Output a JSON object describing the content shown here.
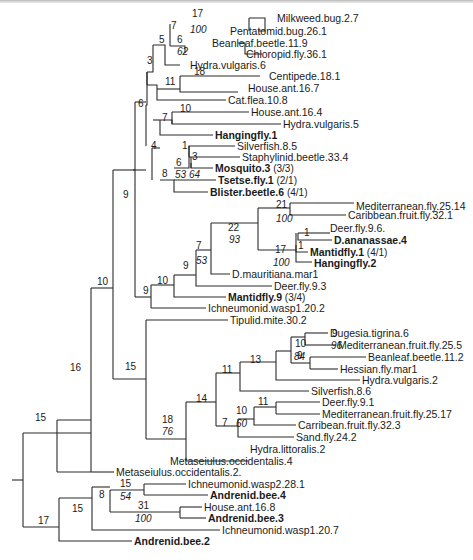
{
  "diagram": {
    "type": "phylogenetic-tree",
    "leaves": [
      {
        "id": "l0",
        "label": "Milkweed.bug.2.7",
        "bold": false,
        "x": 277,
        "y": 18
      },
      {
        "id": "l1",
        "label": "Pentatomid.bug.26.1",
        "bold": false,
        "x": 230,
        "y": 31
      },
      {
        "id": "l2",
        "label": "Beanleaf.beetle.11.9",
        "bold": false,
        "x": 212,
        "y": 43
      },
      {
        "id": "l3",
        "label": "Chloropid.fly.36.1",
        "bold": false,
        "x": 246,
        "y": 54
      },
      {
        "id": "l4",
        "label": "Hydra.vulgaris.6",
        "bold": false,
        "x": 190,
        "y": 65
      },
      {
        "id": "l5",
        "label": "Centipede.18.1",
        "bold": false,
        "x": 269,
        "y": 76
      },
      {
        "id": "l6",
        "label": "House.ant.16.7",
        "bold": false,
        "x": 248,
        "y": 88
      },
      {
        "id": "l7",
        "label": "Cat.flea.10.8",
        "bold": false,
        "x": 228,
        "y": 100
      },
      {
        "id": "l8",
        "label": "House.ant.16.4",
        "bold": false,
        "x": 251,
        "y": 112
      },
      {
        "id": "l9",
        "label": "Hydra.vulgaris.5",
        "bold": false,
        "x": 283,
        "y": 124
      },
      {
        "id": "l10",
        "label": "Hangingfly.1",
        "bold": true,
        "x": 215,
        "y": 135
      },
      {
        "id": "l11",
        "label": "Silverfish.8.5",
        "bold": false,
        "x": 237,
        "y": 146
      },
      {
        "id": "l12",
        "label": "Staphylinid.beetle.33.4",
        "bold": false,
        "x": 242,
        "y": 157
      },
      {
        "id": "l13",
        "label": "Mosquito.3",
        "bold": true,
        "suffix": "(3/3)",
        "x": 215,
        "y": 168
      },
      {
        "id": "l14",
        "label": "Tsetse.fly.1",
        "bold": true,
        "suffix": "(2/1)",
        "x": 218,
        "y": 180
      },
      {
        "id": "l15",
        "label": "Blister.beetle.6",
        "bold": true,
        "suffix": "(4/1)",
        "x": 210,
        "y": 192
      },
      {
        "id": "l16",
        "label": "Mediterranean.fly.25.14",
        "bold": false,
        "x": 356,
        "y": 206
      },
      {
        "id": "l17",
        "label": "Caribbean.fruit.fly.32.1",
        "bold": false,
        "x": 348,
        "y": 215
      },
      {
        "id": "l18",
        "label": "Deer.fly.9.6.",
        "bold": false,
        "x": 330,
        "y": 228
      },
      {
        "id": "l19",
        "label": "D.ananassae.4",
        "bold": true,
        "x": 334,
        "y": 240
      },
      {
        "id": "l20",
        "label": "Mantidfly.1",
        "bold": true,
        "suffix": "(4/1)",
        "x": 310,
        "y": 252
      },
      {
        "id": "l21",
        "label": "Hangingfly.2",
        "bold": true,
        "x": 314,
        "y": 263
      },
      {
        "id": "l22",
        "label": "D.mauritiana.mar1",
        "bold": false,
        "x": 232,
        "y": 274
      },
      {
        "id": "l23",
        "label": "Deer.fly.9.3",
        "bold": false,
        "x": 274,
        "y": 286
      },
      {
        "id": "l24",
        "label": "Mantidfly.9",
        "bold": true,
        "suffix": "(3/4)",
        "x": 228,
        "y": 297
      },
      {
        "id": "l25",
        "label": "Ichneumonid.wasp1.20.2",
        "bold": false,
        "x": 208,
        "y": 308
      },
      {
        "id": "l26",
        "label": "Tipulid.mite.30.2",
        "bold": false,
        "x": 230,
        "y": 320
      },
      {
        "id": "l27",
        "label": "Dugesia.tigrina.6",
        "bold": false,
        "x": 330,
        "y": 333
      },
      {
        "id": "l28",
        "label": "Mediterranean.fruit.fly.25.5",
        "bold": false,
        "x": 338,
        "y": 345
      },
      {
        "id": "l29",
        "label": "Beanleaf.beetle.11.2",
        "bold": false,
        "x": 368,
        "y": 357
      },
      {
        "id": "l30",
        "label": "Hessian.fly.mar1",
        "bold": false,
        "x": 340,
        "y": 369
      },
      {
        "id": "l31",
        "label": "Hydra.vulgaris.2",
        "bold": false,
        "x": 362,
        "y": 380
      },
      {
        "id": "l32",
        "label": "Silverfish.8.6",
        "bold": false,
        "x": 311,
        "y": 391
      },
      {
        "id": "l33",
        "label": "Deer.fly.9.1",
        "bold": false,
        "x": 322,
        "y": 402
      },
      {
        "id": "l34",
        "label": "Mediterranean.fruit.fly.25.17",
        "bold": false,
        "x": 322,
        "y": 414
      },
      {
        "id": "l35",
        "label": "Carribean.fruit.fly.32.3",
        "bold": false,
        "x": 298,
        "y": 425
      },
      {
        "id": "l36",
        "label": "Sand.fly.24.2",
        "bold": false,
        "x": 296,
        "y": 437
      },
      {
        "id": "l37",
        "label": "Hydra.littoralis.2",
        "bold": false,
        "x": 250,
        "y": 449
      },
      {
        "id": "l38",
        "label": "Metaseiulus.occidentalis.4",
        "bold": false,
        "x": 170,
        "y": 461
      },
      {
        "id": "l39",
        "label": "Metaseiulus.occidentalis.2.",
        "bold": false,
        "x": 116,
        "y": 472
      },
      {
        "id": "l40",
        "label": "Ichneumonid.wasp2.28.1",
        "bold": false,
        "x": 188,
        "y": 484
      },
      {
        "id": "l41",
        "label": "Andrenid.bee.4",
        "bold": true,
        "x": 210,
        "y": 495
      },
      {
        "id": "l42",
        "label": "House.ant.16.8",
        "bold": false,
        "x": 204,
        "y": 507
      },
      {
        "id": "l43",
        "label": "Andrenid.bee.3",
        "bold": true,
        "x": 208,
        "y": 518
      },
      {
        "id": "l44",
        "label": "Ichneumonid.wasp1.20.7",
        "bold": false,
        "x": 222,
        "y": 530
      },
      {
        "id": "l45",
        "label": "Andrenid.bee.2",
        "bold": true,
        "x": 134,
        "y": 541
      }
    ],
    "branch_lengths": [
      {
        "text": "17",
        "x": 192,
        "y": 8
      },
      {
        "text": "7",
        "x": 171,
        "y": 20
      },
      {
        "text": "6",
        "x": 177,
        "y": 34
      },
      {
        "text": "5",
        "x": 159,
        "y": 34
      },
      {
        "text": "3",
        "x": 147,
        "y": 55
      },
      {
        "text": "18",
        "x": 194,
        "y": 66
      },
      {
        "text": "11",
        "x": 165,
        "y": 76
      },
      {
        "text": "6",
        "x": 138,
        "y": 98
      },
      {
        "text": "10",
        "x": 180,
        "y": 103
      },
      {
        "text": "7",
        "x": 162,
        "y": 112
      },
      {
        "text": "4",
        "x": 151,
        "y": 140
      },
      {
        "text": "1",
        "x": 182,
        "y": 140
      },
      {
        "text": "3",
        "x": 192,
        "y": 151
      },
      {
        "text": "6",
        "x": 176,
        "y": 157
      },
      {
        "text": "8",
        "x": 162,
        "y": 168
      },
      {
        "text": "9",
        "x": 123,
        "y": 189
      },
      {
        "text": "21",
        "x": 276,
        "y": 199
      },
      {
        "text": "22",
        "x": 228,
        "y": 222
      },
      {
        "text": "1",
        "x": 304,
        "y": 227
      },
      {
        "text": "1",
        "x": 298,
        "y": 240
      },
      {
        "text": "17",
        "x": 275,
        "y": 244
      },
      {
        "text": "7",
        "x": 196,
        "y": 240
      },
      {
        "text": "9",
        "x": 183,
        "y": 260
      },
      {
        "text": "10",
        "x": 157,
        "y": 275
      },
      {
        "text": "9",
        "x": 143,
        "y": 285
      },
      {
        "text": "10",
        "x": 97,
        "y": 276
      },
      {
        "text": "9",
        "x": 332,
        "y": 328
      },
      {
        "text": "10",
        "x": 295,
        "y": 338
      },
      {
        "text": "9",
        "x": 297,
        "y": 350
      },
      {
        "text": "13",
        "x": 250,
        "y": 354
      },
      {
        "text": "11",
        "x": 222,
        "y": 364
      },
      {
        "text": "14",
        "x": 196,
        "y": 393
      },
      {
        "text": "11",
        "x": 258,
        "y": 396
      },
      {
        "text": "10",
        "x": 236,
        "y": 405
      },
      {
        "text": "7",
        "x": 222,
        "y": 417
      },
      {
        "text": "18",
        "x": 162,
        "y": 414
      },
      {
        "text": "15",
        "x": 125,
        "y": 361
      },
      {
        "text": "16",
        "x": 70,
        "y": 362
      },
      {
        "text": "15",
        "x": 35,
        "y": 412
      },
      {
        "text": "15",
        "x": 120,
        "y": 478
      },
      {
        "text": "8",
        "x": 99,
        "y": 489
      },
      {
        "text": "31",
        "x": 138,
        "y": 500
      },
      {
        "text": "15",
        "x": 72,
        "y": 503
      },
      {
        "text": "17",
        "x": 38,
        "y": 515
      }
    ],
    "bootstrap_values": [
      {
        "text": "100",
        "x": 190,
        "y": 24
      },
      {
        "text": "62",
        "x": 177,
        "y": 46
      },
      {
        "text": "53",
        "x": 175,
        "y": 169
      },
      {
        "text": "64",
        "x": 189,
        "y": 169
      },
      {
        "text": "100",
        "x": 276,
        "y": 213
      },
      {
        "text": "93",
        "x": 229,
        "y": 234
      },
      {
        "text": "100",
        "x": 273,
        "y": 257
      },
      {
        "text": "53",
        "x": 196,
        "y": 255
      },
      {
        "text": "96",
        "x": 331,
        "y": 340
      },
      {
        "text": "84",
        "x": 294,
        "y": 351
      },
      {
        "text": "60",
        "x": 236,
        "y": 418
      },
      {
        "text": "76",
        "x": 162,
        "y": 426
      },
      {
        "text": "54",
        "x": 120,
        "y": 491
      },
      {
        "text": "100",
        "x": 135,
        "y": 513
      }
    ]
  },
  "lines": [
    "M249 18H265V31H258",
    "M249 18V31",
    "M238 43H245V54H262",
    "M170 46H185V53H185",
    "M170 24V46",
    "M153 45H165V65H180",
    "M147 72H153V45",
    "M147 72V85",
    "M147 85H157V100H226",
    "M180 76V92H238",
    "M180 76H260",
    "M157 89H180",
    "M146 105V146",
    "M146 105H147V72",
    "M153 120H160",
    "M160 120V135H213",
    "M160 120H172V124H281",
    "M172 112H249",
    "M172 112V124",
    "M152 148V180",
    "M152 148H160",
    "M160 180H174V192H208",
    "M174 168H189V146H235",
    "M189 146V157",
    "M189 157H240",
    "M191 163V168H213",
    "M191 157V168",
    "M174 180H216",
    "M133 170H146",
    "M135 102H146",
    "M135 102V297",
    "M135 297H151",
    "M151 285V308",
    "M151 308H206",
    "M151 285H174",
    "M174 275V297H226",
    "M174 275H196",
    "M196 250V286H272",
    "M196 250H211",
    "M211 223V274H230",
    "M211 223H258",
    "M258 208V250",
    "M258 208H290",
    "M290 203V215H346",
    "M290 203H354",
    "M258 250H296",
    "M296 233V262H312",
    "M296 245V252H308",
    "M298 233H330",
    "M298 233V240H332",
    "M113 170V379",
    "M113 170H135",
    "M113 379H146",
    "M146 320V439",
    "M146 320H228",
    "M146 439H186",
    "M186 402V461",
    "M186 402H216",
    "M186 461H248",
    "M216 373V426",
    "M216 373H240",
    "M240 362V391H309",
    "M240 362H276",
    "M276 351V380H360",
    "M276 351H291",
    "M291 337V363",
    "M291 337H305",
    "M305 333V345",
    "M305 333H328",
    "M305 345H336",
    "M291 363H310",
    "M310 357V369",
    "M310 357H366",
    "M310 369H338",
    "M216 426H238",
    "M238 419V437H294",
    "M238 419H254",
    "M254 407V425H296",
    "M254 407H276",
    "M276 402V414",
    "M276 402H320",
    "M276 414H320",
    "M91 288V472",
    "M91 288H113",
    "M57 472H91",
    "M57 420V472",
    "M57 420H91",
    "M91 472H114",
    "M57 472H57",
    "M23 433H91",
    "M23 433V527",
    "M23 527H59",
    "M59 498V541H132",
    "M59 498H92",
    "M92 487V530H220",
    "M92 487H110",
    "M110 490V512",
    "M110 490H144",
    "M144 484V495",
    "M144 484H186",
    "M144 495H208",
    "M110 512H180",
    "M180 507V518",
    "M180 507H202",
    "M180 518H206",
    "M12 480H23"
  ]
}
